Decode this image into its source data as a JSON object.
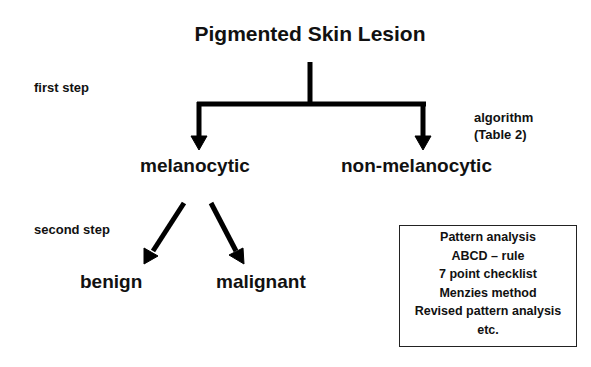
{
  "diagram": {
    "title": "Pigmented Skin Lesion",
    "step_labels": {
      "first": "first step",
      "second": "second step"
    },
    "algorithm_note": {
      "line1": "algorithm",
      "line2": "(Table 2)"
    },
    "nodes": {
      "melanocytic": "melanocytic",
      "non_melanocytic": "non-melanocytic",
      "benign": "benign",
      "malignant": "malignant"
    },
    "methods_box": {
      "items": [
        "Pattern analysis",
        "ABCD – rule",
        "7 point checklist",
        "Menzies method",
        "Revised pattern analysis",
        "etc."
      ]
    },
    "edges": [
      {
        "from": "Pigmented Skin Lesion",
        "to": "melanocytic"
      },
      {
        "from": "Pigmented Skin Lesion",
        "to": "non-melanocytic"
      },
      {
        "from": "melanocytic",
        "to": "benign"
      },
      {
        "from": "melanocytic",
        "to": "malignant"
      }
    ]
  }
}
